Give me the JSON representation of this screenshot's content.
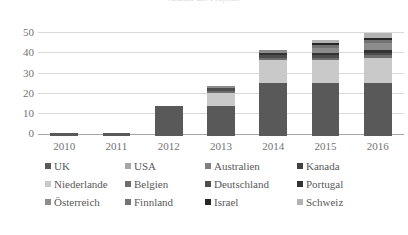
{
  "title": {
    "clipped_text": "Anzahl der Projekte"
  },
  "axes": {
    "y_ticks": [
      "50",
      "40",
      "30",
      "20",
      "10",
      "0"
    ],
    "x_ticks": [
      "2010",
      "2011",
      "2012",
      "2013",
      "2014",
      "2015",
      "2016"
    ]
  },
  "legend": {
    "rows": [
      [
        {
          "label": "UK",
          "color": "#595959"
        },
        {
          "label": "USA",
          "color": "#a6a6a6"
        },
        {
          "label": "Australien",
          "color": "#808080"
        },
        {
          "label": "Kanada",
          "color": "#404040"
        }
      ],
      [
        {
          "label": "Niederlande",
          "color": "#c9c9c9"
        },
        {
          "label": "Belgien",
          "color": "#6e6e6e"
        },
        {
          "label": "Deutschland",
          "color": "#4d4d4d"
        },
        {
          "label": "Portugal",
          "color": "#333333"
        }
      ],
      [
        {
          "label": "Österreich",
          "color": "#8c8c8c"
        },
        {
          "label": "Finnland",
          "color": "#737373"
        },
        {
          "label": "Israel",
          "color": "#262626"
        },
        {
          "label": "Schweiz",
          "color": "#b3b3b3"
        }
      ]
    ]
  },
  "chart_data": {
    "type": "bar",
    "stacked": true,
    "title": "Anzahl der Projekte",
    "xlabel": "",
    "ylabel": "",
    "ylim": [
      0,
      50
    ],
    "grid": true,
    "legend_position": "bottom",
    "categories": [
      "2010",
      "2011",
      "2012",
      "2013",
      "2014",
      "2015",
      "2016"
    ],
    "series": [
      {
        "name": "UK",
        "color": "#595959",
        "values": [
          1,
          1,
          12,
          12,
          21,
          21,
          21
        ]
      },
      {
        "name": "USA",
        "color": "#a6a6a6",
        "values": [
          0,
          0,
          0,
          0,
          0,
          0,
          0
        ]
      },
      {
        "name": "Australien",
        "color": "#808080",
        "values": [
          0,
          0,
          0,
          0,
          0,
          0,
          0
        ]
      },
      {
        "name": "Kanada",
        "color": "#404040",
        "values": [
          0,
          0,
          0,
          0,
          0,
          0,
          0
        ]
      },
      {
        "name": "Niederlande",
        "color": "#c9c9c9",
        "values": [
          0,
          0,
          0,
          5,
          9,
          9,
          10
        ]
      },
      {
        "name": "Belgien",
        "color": "#6e6e6e",
        "values": [
          0,
          0,
          0,
          1,
          1,
          1,
          1
        ]
      },
      {
        "name": "Deutschland",
        "color": "#4d4d4d",
        "values": [
          0,
          0,
          0,
          1,
          1,
          1,
          1
        ]
      },
      {
        "name": "Portugal",
        "color": "#333333",
        "values": [
          0,
          0,
          0,
          0,
          1,
          1,
          1
        ]
      },
      {
        "name": "Österreich",
        "color": "#8c8c8c",
        "values": [
          0,
          0,
          0,
          1,
          1,
          2,
          3
        ]
      },
      {
        "name": "Finnland",
        "color": "#737373",
        "values": [
          0,
          0,
          0,
          0,
          0,
          1,
          1
        ]
      },
      {
        "name": "Israel",
        "color": "#262626",
        "values": [
          0,
          0,
          0,
          0,
          0,
          1,
          1
        ]
      },
      {
        "name": "Schweiz",
        "color": "#b3b3b3",
        "values": [
          0,
          0,
          0,
          0,
          0,
          1,
          2
        ]
      }
    ],
    "totals": [
      1,
      1,
      12,
      20,
      34,
      38,
      41
    ]
  }
}
